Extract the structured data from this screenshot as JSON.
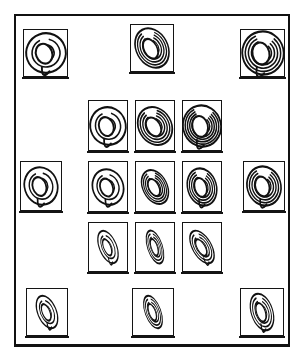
{
  "figure": {
    "background_color": "#ffffff",
    "line_color": "#111111",
    "panel_fill": "#ffffff",
    "outer_frame": {
      "x": 14,
      "y": 14,
      "width": 276,
      "height": 333
    }
  },
  "glyph": {
    "icon_name": "spiral-galaxy-icon",
    "description": "spiral swirl with trailing arms"
  },
  "panels": [
    {
      "id": "outer-top-left",
      "group": "outer",
      "position": "top-left",
      "x": 23,
      "y": 29,
      "w": 45,
      "h": 48,
      "glyph": {
        "name": "spiral-galaxy-icon",
        "size": 22,
        "rotate": -20,
        "squash": 0.92,
        "arms": 2,
        "arm_spread": 34,
        "tail": true
      }
    },
    {
      "id": "outer-top-center",
      "group": "outer",
      "position": "top-center",
      "x": 130,
      "y": 24,
      "w": 44,
      "h": 48,
      "glyph": {
        "name": "spiral-galaxy-icon",
        "size": 23,
        "rotate": -28,
        "squash": 0.7,
        "arms": 4,
        "arm_spread": 46,
        "tail": false
      }
    },
    {
      "id": "outer-top-right",
      "group": "outer",
      "position": "top-right",
      "x": 240,
      "y": 29,
      "w": 45,
      "h": 48,
      "glyph": {
        "name": "spiral-galaxy-icon",
        "size": 24,
        "rotate": -12,
        "squash": 0.88,
        "arms": 4,
        "arm_spread": 52,
        "tail": true
      }
    },
    {
      "id": "outer-middle-left",
      "group": "outer",
      "position": "middle-left",
      "x": 20,
      "y": 161,
      "w": 42,
      "h": 50,
      "glyph": {
        "name": "spiral-galaxy-icon",
        "size": 21,
        "rotate": -18,
        "squash": 0.8,
        "arms": 2,
        "arm_spread": 32,
        "tail": true
      }
    },
    {
      "id": "outer-middle-right",
      "group": "outer",
      "position": "middle-right",
      "x": 243,
      "y": 161,
      "w": 42,
      "h": 50,
      "glyph": {
        "name": "spiral-galaxy-icon",
        "size": 22,
        "rotate": -16,
        "squash": 0.78,
        "arms": 4,
        "arm_spread": 50,
        "tail": true
      }
    },
    {
      "id": "outer-bottom-left",
      "group": "outer",
      "position": "bottom-left",
      "x": 26,
      "y": 288,
      "w": 42,
      "h": 48,
      "glyph": {
        "name": "spiral-galaxy-icon",
        "size": 19,
        "rotate": -22,
        "squash": 0.5,
        "arms": 2,
        "arm_spread": 26,
        "tail": true
      }
    },
    {
      "id": "outer-bottom-center",
      "group": "outer",
      "position": "bottom-center",
      "x": 132,
      "y": 288,
      "w": 42,
      "h": 48,
      "glyph": {
        "name": "spiral-galaxy-icon",
        "size": 19,
        "rotate": -20,
        "squash": 0.42,
        "arms": 3,
        "arm_spread": 24,
        "tail": false
      }
    },
    {
      "id": "outer-bottom-right",
      "group": "outer",
      "position": "bottom-right",
      "x": 240,
      "y": 288,
      "w": 44,
      "h": 48,
      "glyph": {
        "name": "spiral-galaxy-icon",
        "size": 21,
        "rotate": -18,
        "squash": 0.52,
        "arms": 3,
        "arm_spread": 34,
        "tail": true
      }
    },
    {
      "id": "inner-r1-c1",
      "group": "inner",
      "row": 1,
      "col": 1,
      "x": 88,
      "y": 100,
      "w": 40,
      "h": 51,
      "glyph": {
        "name": "spiral-galaxy-icon",
        "size": 21,
        "rotate": -18,
        "squash": 0.86,
        "arms": 2,
        "arm_spread": 36,
        "tail": true
      }
    },
    {
      "id": "inner-r1-c2",
      "group": "inner",
      "row": 1,
      "col": 2,
      "x": 135,
      "y": 100,
      "w": 40,
      "h": 51,
      "glyph": {
        "name": "spiral-galaxy-icon",
        "size": 22,
        "rotate": -30,
        "squash": 0.76,
        "arms": 4,
        "arm_spread": 44,
        "tail": false
      }
    },
    {
      "id": "inner-r1-c3",
      "group": "inner",
      "row": 1,
      "col": 3,
      "x": 182,
      "y": 100,
      "w": 40,
      "h": 51,
      "glyph": {
        "name": "spiral-galaxy-icon",
        "size": 23,
        "rotate": -14,
        "squash": 0.84,
        "arms": 5,
        "arm_spread": 56,
        "tail": true
      }
    },
    {
      "id": "inner-r2-c1",
      "group": "inner",
      "row": 2,
      "col": 1,
      "x": 88,
      "y": 161,
      "w": 40,
      "h": 51,
      "glyph": {
        "name": "spiral-galaxy-icon",
        "size": 20,
        "rotate": -20,
        "squash": 0.78,
        "arms": 2,
        "arm_spread": 34,
        "tail": true
      }
    },
    {
      "id": "inner-r2-c2",
      "group": "inner",
      "row": 2,
      "col": 2,
      "x": 135,
      "y": 161,
      "w": 40,
      "h": 51,
      "glyph": {
        "name": "spiral-galaxy-icon",
        "size": 20,
        "rotate": -26,
        "squash": 0.62,
        "arms": 4,
        "arm_spread": 38,
        "tail": false
      }
    },
    {
      "id": "inner-r2-c3",
      "group": "inner",
      "row": 2,
      "col": 3,
      "x": 182,
      "y": 161,
      "w": 40,
      "h": 51,
      "glyph": {
        "name": "spiral-galaxy-icon",
        "size": 21,
        "rotate": -16,
        "squash": 0.7,
        "arms": 4,
        "arm_spread": 46,
        "tail": true
      }
    },
    {
      "id": "inner-r3-c1",
      "group": "inner",
      "row": 3,
      "col": 1,
      "x": 88,
      "y": 222,
      "w": 40,
      "h": 50,
      "glyph": {
        "name": "spiral-galaxy-icon",
        "size": 19,
        "rotate": -22,
        "squash": 0.46,
        "arms": 2,
        "arm_spread": 24,
        "tail": true
      }
    },
    {
      "id": "inner-r3-c2",
      "group": "inner",
      "row": 3,
      "col": 2,
      "x": 135,
      "y": 222,
      "w": 40,
      "h": 50,
      "glyph": {
        "name": "spiral-galaxy-icon",
        "size": 19,
        "rotate": -18,
        "squash": 0.4,
        "arms": 3,
        "arm_spread": 22,
        "tail": false
      }
    },
    {
      "id": "inner-r3-c3",
      "group": "inner",
      "row": 3,
      "col": 3,
      "x": 182,
      "y": 222,
      "w": 40,
      "h": 50,
      "glyph": {
        "name": "spiral-galaxy-icon",
        "size": 20,
        "rotate": -30,
        "squash": 0.48,
        "arms": 3,
        "arm_spread": 30,
        "tail": true
      }
    }
  ]
}
